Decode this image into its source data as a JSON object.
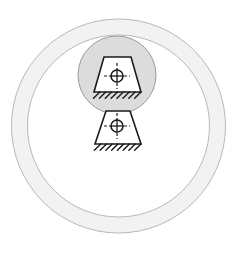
{
  "figure": {
    "canvas": {
      "width": 237,
      "height": 258,
      "background": "#ffffff"
    },
    "outer_ring": {
      "name": "outer-annulus",
      "center_x": 118.5,
      "center_y": 126,
      "outer_radius": 107,
      "inner_radius": 91,
      "fill": "#f2f2f2",
      "stroke": "#b8b8b8",
      "stroke_width": 1
    },
    "shaded_circle": {
      "name": "shaded-region-circle",
      "center_x": 117,
      "center_y": 75,
      "radius": 39,
      "fill": "#dcdcdc",
      "stroke": "#9a9a9a",
      "stroke_width": 1
    },
    "upper_support": {
      "name": "upper-fixed-support",
      "top_left_x": 104,
      "top_right_x": 131,
      "top_y": 57,
      "bottom_left_x": 94,
      "bottom_right_x": 141,
      "bottom_y": 92,
      "fill": "#ffffff",
      "stroke": "#1a1a1a",
      "stroke_width": 1.6,
      "hatch_count": 8,
      "hatch_length": 9,
      "hatch_angle_deg": 45,
      "crosshair": {
        "name": "upper-crosshair-target",
        "center_x": 117,
        "center_y": 76,
        "radius": 6,
        "arm_length": 13,
        "dash": "3,2",
        "stroke": "#1a1a1a"
      }
    },
    "lower_support": {
      "name": "lower-fixed-support",
      "top_left_x": 106,
      "top_right_x": 130,
      "top_y": 111,
      "bottom_left_x": 95,
      "bottom_right_x": 141,
      "bottom_y": 144,
      "fill": "#ffffff",
      "stroke": "#1a1a1a",
      "stroke_width": 1.6,
      "hatch_count": 8,
      "hatch_length": 9,
      "hatch_angle_deg": 45,
      "crosshair": {
        "name": "lower-crosshair-target",
        "center_x": 117,
        "center_y": 126,
        "radius": 6,
        "arm_length": 13,
        "dash": "3,2",
        "stroke": "#1a1a1a"
      }
    }
  },
  "colors": {
    "ring_fill": "#f2f2f2",
    "ring_stroke": "#b8b8b8",
    "shade_fill": "#dcdcdc",
    "shade_stroke": "#9a9a9a",
    "line": "#1a1a1a",
    "background": "#ffffff"
  }
}
